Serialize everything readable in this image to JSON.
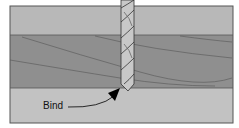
{
  "diagram": {
    "type": "cross-section",
    "label": "Bind",
    "colors": {
      "top_layer": "#b8b8b8",
      "middle_layer": "#8f8f8f",
      "bottom_layer": "#c2c2c2",
      "drill_bit": "#c8c8c8",
      "outline": "#333333",
      "arrow": "#000000"
    }
  }
}
